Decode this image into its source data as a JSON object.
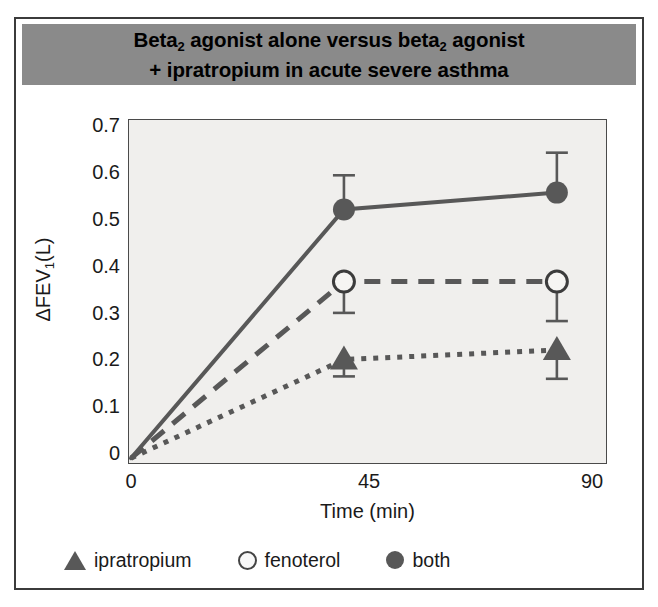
{
  "figure": {
    "title_line1": "Beta2 agonist alone versus beta2 agonist",
    "title_line2": "+ ipratropium in acute severe asthma",
    "title_bar_color": "#8a8a8a",
    "plot_background": "#f0efed",
    "marker_color": "#585858"
  },
  "chart_data": {
    "type": "line",
    "title": "Beta2 agonist alone versus beta2 agonist + ipratropium in acute severe asthma",
    "xlabel": "Time (min)",
    "ylabel": "ΔFEV1(L)",
    "x": [
      0,
      45,
      90
    ],
    "xticks": [
      "0",
      "45",
      "90"
    ],
    "xlim": [
      0,
      97
    ],
    "yticks": [
      "0",
      "0.1",
      "0.2",
      "0.3",
      "0.4",
      "0.5",
      "0.6",
      "0.7"
    ],
    "ylim": [
      0,
      0.715
    ],
    "grid": false,
    "legend_position": "below-axes",
    "series": [
      {
        "name": "ipratropium",
        "marker": "filled-triangle",
        "line_style": "dotted",
        "color": "#585858",
        "values": [
          0.01,
          0.215,
          0.235
        ],
        "errors_low": [
          null,
          0.18,
          0.175
        ],
        "errors_high": [
          null,
          0.215,
          0.235
        ]
      },
      {
        "name": "fenoterol",
        "marker": "open-circle",
        "line_style": "dashed",
        "color": "#585858",
        "values": [
          0.01,
          0.377,
          0.377
        ],
        "errors_low": [
          null,
          0.312,
          0.295
        ],
        "errors_high": [
          null,
          0.377,
          0.377
        ]
      },
      {
        "name": "both",
        "marker": "filled-circle",
        "line_style": "solid",
        "color": "#585858",
        "values": [
          0.01,
          0.527,
          0.562
        ],
        "errors_low": [
          null,
          0.527,
          0.562
        ],
        "errors_high": [
          null,
          0.598,
          0.645
        ]
      }
    ]
  },
  "legend": {
    "items": [
      {
        "label": "ipratropium",
        "marker": "filled-triangle"
      },
      {
        "label": "fenoterol",
        "marker": "open-circle"
      },
      {
        "label": "both",
        "marker": "filled-circle"
      }
    ]
  }
}
